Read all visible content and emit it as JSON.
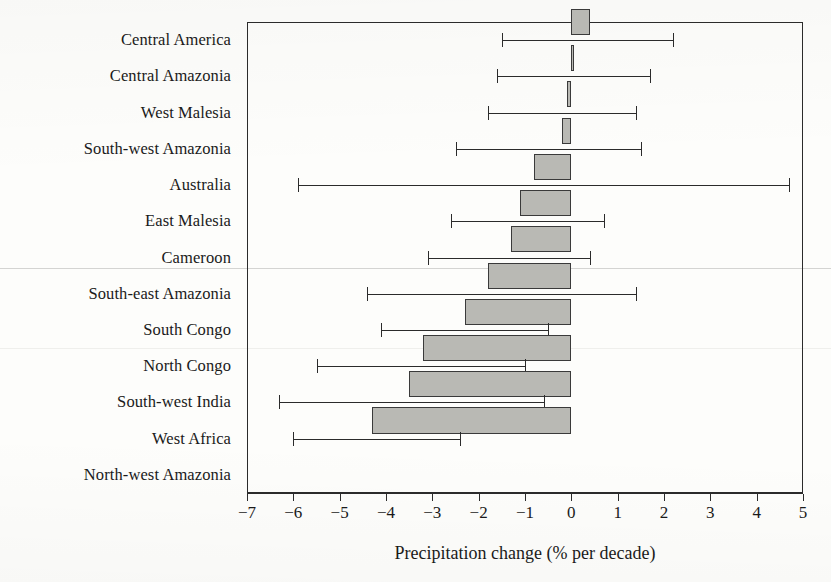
{
  "chart_data": {
    "type": "bar",
    "orientation": "horizontal",
    "title": "",
    "subtitle": "",
    "xlabel": "Precipitation change (% per decade)",
    "ylabel": "",
    "xlim": [
      -7,
      5
    ],
    "xticks": [
      -7,
      -6,
      -5,
      -4,
      -3,
      -2,
      -1,
      0,
      1,
      2,
      3,
      4,
      5
    ],
    "xtick_labels": [
      "−7",
      "−6",
      "−5",
      "−4",
      "−3",
      "−2",
      "−1",
      "0",
      "1",
      "2",
      "3",
      "4",
      "5"
    ],
    "grid": false,
    "legend": false,
    "error_bars": true,
    "bar_fill_color": "#b9b9b4",
    "bar_edge_color": "#3a3a3a",
    "axis_color": "#2b2b2b",
    "categories": [
      "Central America",
      "Central Amazonia",
      "West Malesia",
      "South-west Amazonia",
      "Australia",
      "East Malesia",
      "Cameroon",
      "South-east Amazonia",
      "South Congo",
      "North Congo",
      "South-west India",
      "West Africa",
      "North-west Amazonia"
    ],
    "values": [
      0.4,
      0.05,
      -0.1,
      -0.2,
      -0.8,
      -1.1,
      -1.3,
      -1.8,
      -2.3,
      -3.2,
      -3.5,
      -4.3,
      null
    ],
    "err_low": [
      -1.5,
      -1.6,
      -1.8,
      -2.5,
      -5.9,
      -2.6,
      -3.1,
      -4.4,
      -4.1,
      -5.5,
      -6.3,
      -6.0,
      null
    ],
    "err_high": [
      2.2,
      1.7,
      1.4,
      1.5,
      4.7,
      0.7,
      0.4,
      1.4,
      -0.5,
      -1.0,
      -0.6,
      -2.4,
      null
    ]
  }
}
